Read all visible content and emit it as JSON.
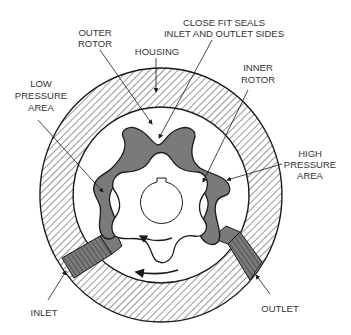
{
  "diagram": {
    "labels": {
      "outer_rotor": [
        "OUTER",
        "ROTOR"
      ],
      "housing": "HOUSING",
      "close_fit": [
        "CLOSE FIT SEALS",
        "INLET AND OUTLET SIDES"
      ],
      "inner_rotor": [
        "INNER",
        "ROTOR"
      ],
      "low_pressure": [
        "LOW",
        "PRESSURE",
        "AREA"
      ],
      "high_pressure": [
        "HIGH",
        "PRESSURE",
        "AREA"
      ],
      "inlet": "INLET",
      "outlet": "OUTLET"
    },
    "colors": {
      "line": "#1a1a1a",
      "fluid": "#7a7a7a",
      "background": "#ffffff",
      "text": "#333333"
    }
  }
}
